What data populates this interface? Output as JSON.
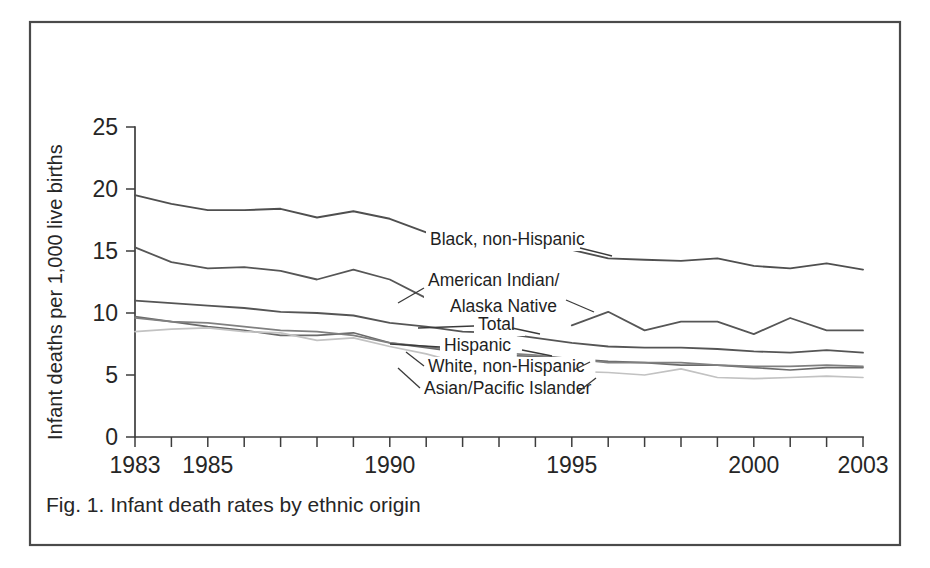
{
  "figure": {
    "caption": "Fig. 1. Infant death rates by ethnic origin",
    "frame_color": "#4a4a4a",
    "background": "#ffffff"
  },
  "chart_data": {
    "type": "line",
    "title": "",
    "subtitle": "",
    "xlabel": "",
    "ylabel": "Infant deaths per 1,000 live births",
    "xlim": [
      1983,
      2003
    ],
    "ylim": [
      0,
      25
    ],
    "ytick_values": [
      0,
      5,
      10,
      15,
      20,
      25
    ],
    "ytick_labels": [
      "0",
      "5",
      "10",
      "15",
      "20",
      "25"
    ],
    "xtick_values": [
      1983,
      1984,
      1985,
      1986,
      1987,
      1988,
      1989,
      1990,
      1991,
      1992,
      1993,
      1994,
      1995,
      1996,
      1997,
      1998,
      1999,
      2000,
      2001,
      2002,
      2003
    ],
    "xtick_labeled": [
      1983,
      1985,
      1990,
      1995,
      2000,
      2003
    ],
    "xtick_labels": [
      "1983",
      "1985",
      "1990",
      "1995",
      "2000",
      "2003"
    ],
    "grid": false,
    "legend_position": "inline-annotations",
    "x": [
      1983,
      1984,
      1985,
      1986,
      1987,
      1988,
      1989,
      1990,
      1991,
      1992,
      1993,
      1994,
      1995,
      1996,
      1997,
      1998,
      1999,
      2000,
      2001,
      2002,
      2003
    ],
    "series": [
      {
        "name": "Black, non-Hispanic",
        "label": "Black, non-Hispanic",
        "color": "#4f4f4f",
        "width": 1.9,
        "values": [
          19.5,
          18.8,
          18.3,
          18.3,
          18.4,
          17.7,
          18.2,
          17.6,
          16.5,
          null,
          null,
          null,
          15.1,
          14.4,
          14.3,
          14.2,
          14.4,
          13.8,
          13.6,
          14.0,
          13.5
        ]
      },
      {
        "name": "American Indian/Alaska Native",
        "label": "American Indian/\nAlaska Native",
        "label_lines": [
          "American Indian/",
          "Alaska Native"
        ],
        "color": "#565656",
        "width": 1.8,
        "values": [
          15.3,
          14.1,
          13.6,
          13.7,
          13.4,
          12.7,
          13.5,
          12.7,
          11.2,
          null,
          null,
          null,
          9.0,
          10.1,
          8.6,
          9.3,
          9.3,
          8.3,
          9.6,
          8.6,
          8.6
        ]
      },
      {
        "name": "Total",
        "label": "Total",
        "color": "#555555",
        "width": 1.8,
        "values": [
          11.0,
          10.8,
          10.6,
          10.4,
          10.1,
          10.0,
          9.8,
          9.2,
          8.9,
          8.5,
          8.4,
          8.0,
          7.6,
          7.3,
          7.2,
          7.2,
          7.1,
          6.9,
          6.8,
          7.0,
          6.8
        ]
      },
      {
        "name": "Hispanic",
        "label": "Hispanic",
        "color": "#6b6b6b",
        "width": 1.7,
        "values": [
          9.7,
          9.3,
          8.9,
          8.6,
          8.2,
          8.2,
          8.4,
          7.6,
          7.2,
          6.8,
          6.6,
          6.5,
          6.3,
          6.1,
          6.0,
          5.8,
          5.8,
          5.6,
          5.4,
          5.6,
          5.6
        ]
      },
      {
        "name": "White, non-Hispanic",
        "label": "White, non-Hispanic",
        "color": "#808080",
        "width": 1.7,
        "values": [
          9.6,
          9.3,
          9.2,
          8.9,
          8.6,
          8.5,
          8.2,
          7.6,
          7.3,
          6.9,
          6.8,
          6.6,
          6.3,
          6.0,
          6.0,
          6.0,
          5.8,
          5.7,
          5.7,
          5.8,
          5.7
        ]
      },
      {
        "name": "Asian/Pacific Islander",
        "label": "Asian/Pacific Islander",
        "color": "#c2c2c2",
        "width": 1.7,
        "values": [
          8.5,
          8.7,
          8.8,
          8.5,
          8.4,
          7.8,
          8.0,
          7.3,
          6.7,
          5.9,
          5.5,
          5.4,
          5.3,
          5.2,
          5.0,
          5.5,
          4.8,
          4.7,
          4.8,
          4.9,
          4.8
        ]
      }
    ],
    "annotations": [
      {
        "text": "Black, non-Hispanic",
        "series": "Black, non-Hispanic"
      },
      {
        "text": "American Indian/ Alaska Native",
        "series": "American Indian/Alaska Native"
      },
      {
        "text": "Total",
        "series": "Total"
      },
      {
        "text": "Hispanic",
        "series": "Hispanic"
      },
      {
        "text": "White, non-Hispanic",
        "series": "White, non-Hispanic"
      },
      {
        "text": "Asian/Pacific Islander",
        "series": "Asian/Pacific Islander"
      }
    ]
  }
}
